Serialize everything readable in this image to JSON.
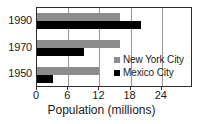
{
  "chart_data": {
    "type": "bar",
    "orientation": "horizontal",
    "title": "",
    "xlabel": "Population (millions)",
    "ylabel": "",
    "categories": [
      "1990",
      "1970",
      "1950"
    ],
    "series": [
      {
        "name": "New York City",
        "color": "#8c8c8c",
        "values": [
          16,
          16,
          12
        ]
      },
      {
        "name": "Mexico City",
        "color": "#000000",
        "values": [
          20,
          9,
          3
        ]
      }
    ],
    "xlim": [
      0,
      30
    ],
    "xticks": [
      0,
      6,
      12,
      18,
      24
    ],
    "xtick_labels": [
      "0",
      "6",
      "12",
      "18",
      "24"
    ],
    "grid": true,
    "legend_position": "inside-right"
  },
  "axis": {
    "x_title": "Population (millions)"
  },
  "legend": {
    "items": [
      {
        "label": "New York City",
        "color": "#8c8c8c"
      },
      {
        "label": "Mexico City",
        "color": "#000000"
      }
    ]
  }
}
